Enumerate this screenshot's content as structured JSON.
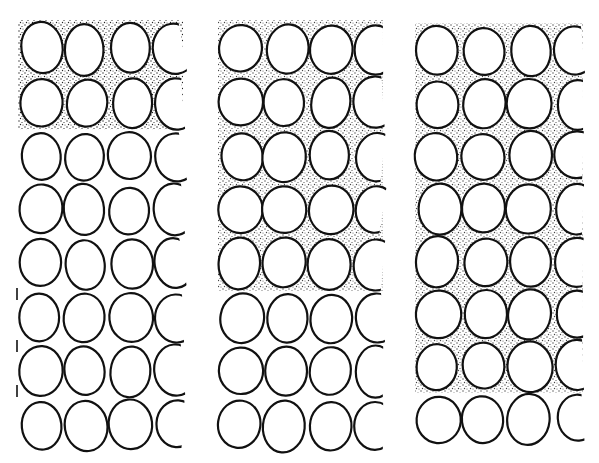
{
  "figure": {
    "width": 599,
    "height": 463,
    "colors": {
      "ink": "#111111",
      "paper": "#ffffff",
      "stipple": "#222222"
    },
    "panels": [
      {
        "id": "panel-1",
        "x": 18,
        "y": 22,
        "w": 165,
        "h": 430,
        "cols": 4,
        "rows": 8,
        "cell_w": 48,
        "cell_h": 50,
        "shaded_rows": [
          0,
          1
        ],
        "shade_mode": "full",
        "left_ticks": [
          288,
          340,
          385
        ]
      },
      {
        "id": "panel-2",
        "x": 218,
        "y": 22,
        "w": 165,
        "h": 430,
        "cols": 4,
        "rows": 8,
        "cell_w": 47,
        "cell_h": 50,
        "shaded_rows": [
          0,
          1,
          2,
          3,
          4
        ],
        "shade_mode": "gaps",
        "left_ticks": []
      },
      {
        "id": "panel-3",
        "x": 415,
        "y": 25,
        "w": 168,
        "h": 420,
        "cols": 4,
        "rows": 8,
        "cell_w": 48,
        "cell_h": 51,
        "shaded_rows": [
          0,
          1,
          2,
          3,
          4,
          5,
          6
        ],
        "shade_mode": "gaps",
        "left_ticks": []
      }
    ]
  }
}
